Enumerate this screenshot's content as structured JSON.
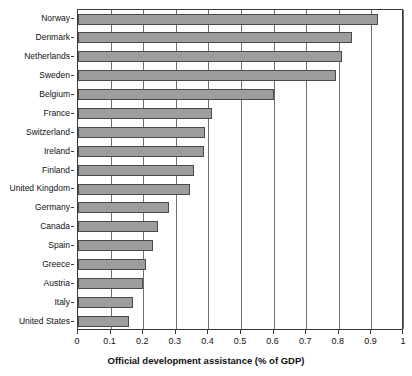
{
  "chart_data": {
    "type": "bar",
    "orientation": "horizontal",
    "title": "",
    "xlabel": "Official development assistance (% of GDP)",
    "ylabel": "",
    "xlim": [
      0,
      1
    ],
    "xticks": [
      0,
      0.1,
      0.2,
      0.3,
      0.4,
      0.5,
      0.6,
      0.7,
      0.8,
      0.9,
      1
    ],
    "xtick_labels": [
      "0",
      "0.1",
      "0.2",
      "0.3",
      "0.4",
      "0.5",
      "0.6",
      "0.7",
      "0.8",
      "0.9",
      "1"
    ],
    "grid": "vertical",
    "legend": "none",
    "bar_color": "#9d9d9d",
    "bar_edge_color": "#4a4a4a",
    "categories": [
      "Norway",
      "Denmark",
      "Netherlands",
      "Sweden",
      "Belgium",
      "France",
      "Switzerland",
      "Ireland",
      "Finland",
      "United Kingdom",
      "Germany",
      "Canada",
      "Spain",
      "Greece",
      "Austria",
      "Italy",
      "United States"
    ],
    "values": [
      0.92,
      0.84,
      0.81,
      0.79,
      0.6,
      0.41,
      0.39,
      0.385,
      0.355,
      0.345,
      0.28,
      0.245,
      0.23,
      0.21,
      0.2,
      0.17,
      0.155
    ]
  }
}
